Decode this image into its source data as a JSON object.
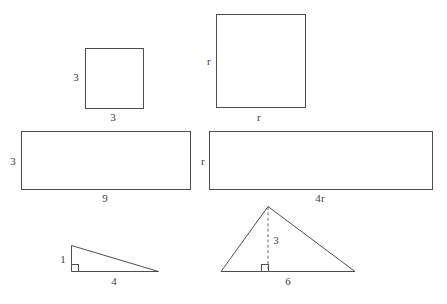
{
  "diagram": {
    "background_color": "#ffffff",
    "stroke_color": "#4f4f4f",
    "label_color": "#3d3d3d",
    "width": 447,
    "height": 304,
    "figures": [
      {
        "name": "small-square",
        "type": "square",
        "x": 85,
        "y": 48,
        "width": 58,
        "height": 60,
        "labels": [
          {
            "name": "small-square-side-label",
            "text": "3",
            "x": 76,
            "y": 77
          },
          {
            "name": "small-square-base-label",
            "text": "3",
            "x": 113,
            "y": 117
          }
        ]
      },
      {
        "name": "large-square",
        "type": "square",
        "x": 216,
        "y": 14,
        "width": 89,
        "height": 93,
        "labels": [
          {
            "name": "large-square-side-label",
            "text": "r",
            "x": 209,
            "y": 61
          },
          {
            "name": "large-square-base-label",
            "text": "r",
            "x": 259,
            "y": 117
          }
        ]
      },
      {
        "name": "left-rectangle",
        "type": "rectangle",
        "x": 21,
        "y": 131,
        "width": 169,
        "height": 58,
        "labels": [
          {
            "name": "left-rectangle-side-label",
            "text": "3",
            "x": 13,
            "y": 161
          },
          {
            "name": "left-rectangle-base-label",
            "text": "9",
            "x": 105,
            "y": 198
          }
        ]
      },
      {
        "name": "right-rectangle",
        "type": "rectangle",
        "x": 209,
        "y": 131,
        "width": 223,
        "height": 58,
        "labels": [
          {
            "name": "right-rectangle-side-label",
            "text": "r",
            "x": 203,
            "y": 161
          },
          {
            "name": "right-rectangle-base-label",
            "text": "4r",
            "x": 320,
            "y": 198
          }
        ]
      },
      {
        "name": "small-right-triangle",
        "type": "right-triangle",
        "points": [
          [
            71,
            245
          ],
          [
            71,
            271
          ],
          [
            158,
            271
          ]
        ],
        "right_angle_vertex": [
          71,
          271
        ],
        "labels": [
          {
            "name": "small-triangle-height-label",
            "text": "1",
            "x": 63,
            "y": 259
          },
          {
            "name": "small-triangle-base-label",
            "text": "4",
            "x": 114,
            "y": 281
          }
        ]
      },
      {
        "name": "large-triangle",
        "type": "triangle",
        "points": [
          [
            268,
            206
          ],
          [
            221,
            271
          ],
          [
            355,
            271
          ]
        ],
        "altitude": {
          "from": [
            268,
            206
          ],
          "to": [
            268,
            271
          ],
          "style": "dashed"
        },
        "right_angle_vertex": [
          268,
          271
        ],
        "labels": [
          {
            "name": "large-triangle-height-label",
            "text": "3",
            "x": 276,
            "y": 240
          },
          {
            "name": "large-triangle-base-label",
            "text": "6",
            "x": 288,
            "y": 281
          }
        ]
      }
    ]
  }
}
